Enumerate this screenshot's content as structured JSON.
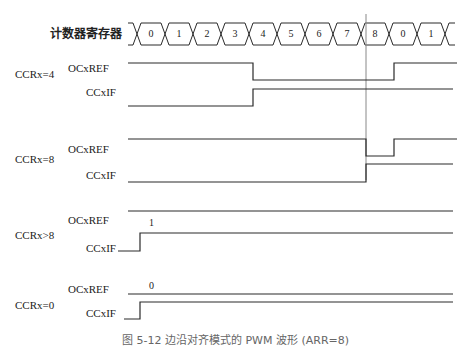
{
  "counter": {
    "label": "计数器寄存器",
    "values": [
      "0",
      "1",
      "2",
      "3",
      "4",
      "5",
      "6",
      "7",
      "8",
      "0",
      "1"
    ]
  },
  "groups": [
    {
      "name": "CCRx=4",
      "ref_label": "OCxREF",
      "if_label": "CCxIF"
    },
    {
      "name": "CCRx=8",
      "ref_label": "OCxREF",
      "if_label": "CCxIF"
    },
    {
      "name": "CCRx>8",
      "ref_label": "OCxREF",
      "if_label": "CCxIF",
      "ref_note": "1"
    },
    {
      "name": "CCRx=0",
      "ref_label": "OCxREF",
      "if_label": "CCxIF",
      "ref_note": "0"
    }
  ],
  "caption": "图 5-12  边沿对齐模式的 PWM 波形 (ARR=8)",
  "colors": {
    "line": "#2a2a2a",
    "cursor": "#888888"
  }
}
